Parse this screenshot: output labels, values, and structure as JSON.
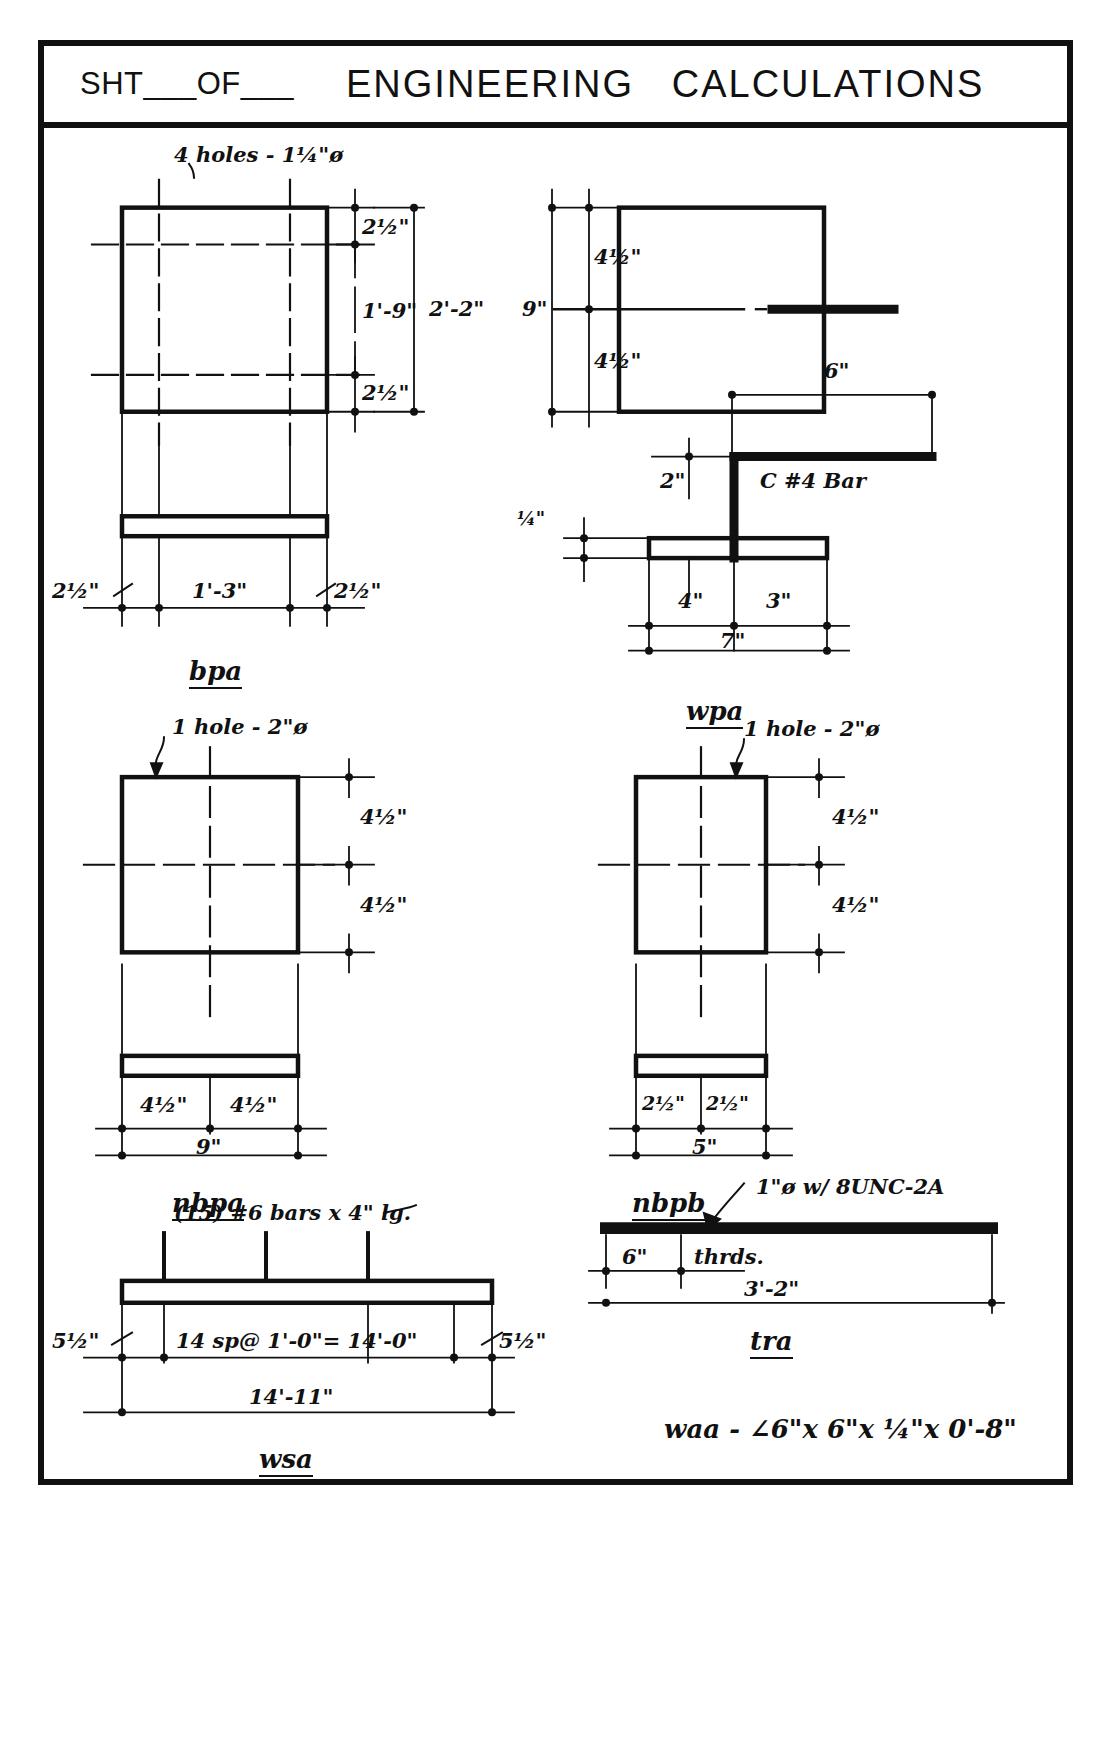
{
  "sheet": {
    "sht_of": "SHT___OF___",
    "title": "ENGINEERING   CALCULATIONS"
  },
  "drawings": [
    {
      "id": "bpa",
      "label": "bpa",
      "notes": [
        "4 holes - 1¼\"ø"
      ],
      "dims": [
        "2½\"",
        "2'-2\"",
        "1'-9\"",
        "2½\"",
        "2½\"",
        "1'-3\"",
        "2½\""
      ]
    },
    {
      "id": "wpa",
      "label": "wpa",
      "notes": [
        "C #4 Bar"
      ],
      "dims": [
        "4½\"",
        "9\"",
        "4½\"",
        "6\"",
        "2\"",
        "¼\"",
        "4\"",
        "3\"",
        "7\""
      ]
    },
    {
      "id": "nbpa",
      "label": "nbpa",
      "notes": [
        "1 hole - 2\"ø"
      ],
      "dims": [
        "4½\"",
        "4½\"",
        "4½\"",
        "4½\"",
        "9\""
      ]
    },
    {
      "id": "nbpb",
      "label": "nbpb",
      "notes": [
        "1 hole - 2\"ø"
      ],
      "dims": [
        "4½\"",
        "4½\"",
        "2½\"",
        "2½\"",
        "5\""
      ]
    },
    {
      "id": "wsa",
      "label": "wsa",
      "notes": [
        "(15) #6 bars x 4\" lg."
      ],
      "dims": [
        "5½\"",
        "14 sp @ 1'-0\" = 14'-0\"",
        "5½\"",
        "14'-11\""
      ]
    },
    {
      "id": "tra",
      "label": "tra",
      "notes": [
        "1\"ø w/ 8UNC-2A"
      ],
      "dims": [
        "6\"",
        "thrds.",
        "3'-2\""
      ]
    }
  ],
  "bpa": {
    "note_holes": "4 holes - 1¼\"ø",
    "dim_top_edge": "2½\"",
    "dim_overall_v": "2'-2\"",
    "dim_inner_v": "1'-9\"",
    "dim_bot_edge": "2½\"",
    "dim_left": "2½\"",
    "dim_center": "1'-3\"",
    "dim_right": "2½\"",
    "label": "bpa"
  },
  "wpa_plan": {
    "dim_upper": "4½\"",
    "dim_overall": "9\"",
    "dim_lower": "4½\""
  },
  "wpa": {
    "dim_6": "6\"",
    "note_bar": "C #4 Bar",
    "dim_2": "2\"",
    "dim_quarter": "¼\"",
    "dim_4": "4\"",
    "dim_3": "3\"",
    "dim_7": "7\"",
    "label": "wpa"
  },
  "nbpa": {
    "note_hole": "1 hole - 2\"ø",
    "dim_upper": "4½\"",
    "dim_lower": "4½\"",
    "dim_left": "4½\"",
    "dim_right": "4½\"",
    "dim_overall": "9\"",
    "label": "nbpa"
  },
  "nbpb": {
    "note_hole": "1 hole - 2\"ø",
    "dim_upper": "4½\"",
    "dim_lower": "4½\"",
    "dim_left": "2½\"",
    "dim_right": "2½\"",
    "dim_overall": "5\"",
    "label": "nbpb"
  },
  "tra": {
    "note_thread": "1\"ø w/ 8UNC-2A",
    "dim_6": "6\"",
    "dim_thrds": "thrds.",
    "dim_overall": "3'-2\"",
    "label": "tra"
  },
  "waa": {
    "callout": "waa - ∠6\"x 6\"x ¼\"x 0'-8\""
  },
  "wsa": {
    "note_bars": "(15) #6 bars x 4\" lg.",
    "dim_left": "5½\"",
    "dim_spacing": "14 sp@ 1'-0\"= 14'-0\"",
    "dim_right": "5½\"",
    "dim_overall": "14'-11\"",
    "label": "wsa"
  },
  "colors": {
    "ink": "#111111",
    "paper": "#ffffff"
  }
}
